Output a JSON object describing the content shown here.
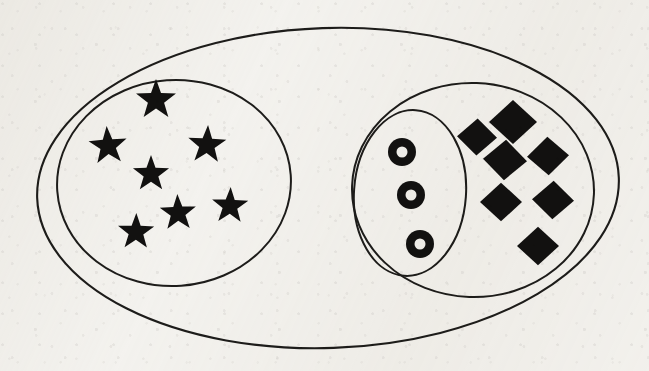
{
  "document": {
    "title": "Nested set / Venn diagram",
    "kind": "hand-drawn scanned set diagram",
    "background_color": "#f3f2ef",
    "ink_color": "#1d1c1a",
    "glyph_color": "#121110"
  },
  "canvas": {
    "width": 649,
    "height": 371
  },
  "sets": [
    {
      "id": "universe",
      "name": "outer-ellipse",
      "shape": "ellipse",
      "cx": 328,
      "cy": 188,
      "rx": 291,
      "ry": 160,
      "rotation": -2,
      "stroke_width": 2.1,
      "contains": [
        "left-set",
        "right-set"
      ]
    },
    {
      "id": "left-set",
      "name": "left-ellipse",
      "shape": "ellipse",
      "cx": 174,
      "cy": 183,
      "rx": 117,
      "ry": 103,
      "rotation": -4,
      "stroke_width": 2.0,
      "contains": [
        "stars"
      ]
    },
    {
      "id": "right-set",
      "name": "right-ellipse",
      "shape": "ellipse",
      "cx": 473,
      "cy": 190,
      "rx": 121,
      "ry": 107,
      "rotation": 2,
      "stroke_width": 2.0,
      "contains": [
        "inner-set",
        "diamonds"
      ]
    },
    {
      "id": "inner-set",
      "name": "inner-ellipse",
      "shape": "ellipse",
      "cx": 410,
      "cy": 193,
      "rx": 56,
      "ry": 83,
      "rotation": 4,
      "stroke_width": 2.0,
      "contains": [
        "rings"
      ]
    }
  ],
  "elements": {
    "stars": {
      "label": "star",
      "count": 7,
      "set": "left-set",
      "items": [
        {
          "cx": 156,
          "cy": 100,
          "r": 21,
          "rot": 0
        },
        {
          "cx": 108,
          "cy": 146,
          "r": 20,
          "rot": -4
        },
        {
          "cx": 207,
          "cy": 145,
          "r": 20,
          "rot": 3
        },
        {
          "cx": 151,
          "cy": 174,
          "r": 19,
          "rot": 0
        },
        {
          "cx": 230,
          "cy": 206,
          "r": 19,
          "rot": 2
        },
        {
          "cx": 178,
          "cy": 213,
          "r": 19,
          "rot": -2
        },
        {
          "cx": 136,
          "cy": 232,
          "r": 19,
          "rot": 1
        }
      ]
    },
    "rings": {
      "label": "ring",
      "count": 3,
      "set": "inner-set",
      "items": [
        {
          "cx": 402,
          "cy": 152,
          "r_outer": 14,
          "r_inner": 5.5
        },
        {
          "cx": 411,
          "cy": 195,
          "r_outer": 14,
          "r_inner": 5.5
        },
        {
          "cx": 420,
          "cy": 244,
          "r_outer": 14,
          "r_inner": 5.5
        }
      ]
    },
    "diamonds": {
      "label": "diamond",
      "count": 7,
      "set": "right-set",
      "items": [
        {
          "cx": 477,
          "cy": 137,
          "r": 20,
          "rot": 2
        },
        {
          "cx": 513,
          "cy": 122,
          "r": 24,
          "rot": 0
        },
        {
          "cx": 505,
          "cy": 160,
          "r": 22,
          "rot": 3
        },
        {
          "cx": 548,
          "cy": 156,
          "r": 21,
          "rot": -2
        },
        {
          "cx": 501,
          "cy": 202,
          "r": 21,
          "rot": 0
        },
        {
          "cx": 553,
          "cy": 200,
          "r": 21,
          "rot": 2
        },
        {
          "cx": 538,
          "cy": 246,
          "r": 21,
          "rot": 0
        }
      ]
    }
  },
  "legend": {
    "star_set_label": "",
    "ring_set_label": "",
    "diamond_set_label": ""
  }
}
